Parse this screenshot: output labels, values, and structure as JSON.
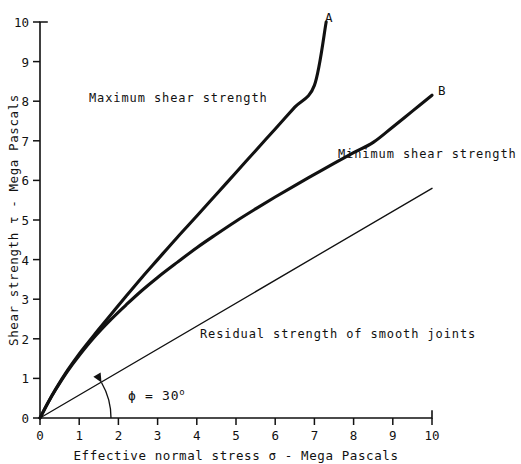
{
  "chart_data": {
    "type": "line",
    "title": "",
    "xlabel": "Effective normal stress σ - Mega Pascals",
    "ylabel": "Shear strength τ - Mega Pascals",
    "xlim": [
      0,
      10
    ],
    "ylim": [
      0,
      10
    ],
    "xticks": [
      0,
      1,
      2,
      3,
      4,
      5,
      6,
      7,
      8,
      9,
      10
    ],
    "yticks": [
      0,
      1,
      2,
      3,
      4,
      5,
      6,
      7,
      8,
      9,
      10
    ],
    "xtick_labels": [
      "0",
      "1",
      "2",
      "3",
      "4",
      "5",
      "6",
      "7",
      "8",
      "9",
      "10"
    ],
    "ytick_labels": [
      "0",
      "1",
      "2",
      "3",
      "4",
      "5",
      "6",
      "7",
      "8",
      "9",
      "10"
    ],
    "grid": false,
    "legend": "none",
    "series": [
      {
        "name": "Maximum shear strength",
        "endpoint_label": "A",
        "style": "thick-curve",
        "x": [
          0,
          0.2,
          0.4,
          0.7,
          1.0,
          1.4,
          1.8,
          2.2,
          2.6,
          3.0,
          3.5,
          4.0,
          4.5,
          5.0,
          5.5,
          6.0,
          6.5,
          7.0,
          7.3
        ],
        "y": [
          0,
          0.38,
          0.73,
          1.2,
          1.62,
          2.12,
          2.6,
          3.08,
          3.55,
          4.0,
          4.56,
          5.1,
          5.65,
          6.2,
          6.75,
          7.3,
          7.85,
          8.4,
          10.0
        ]
      },
      {
        "name": "Minimum shear strength",
        "endpoint_label": "B",
        "style": "thick-curve",
        "x": [
          0,
          0.2,
          0.4,
          0.7,
          1.0,
          1.4,
          1.8,
          2.2,
          2.6,
          3.0,
          3.5,
          4.0,
          4.5,
          5.0,
          5.5,
          6.0,
          6.5,
          7.0,
          7.5,
          8.0,
          8.5,
          9.0,
          9.5,
          10.0
        ],
        "y": [
          0,
          0.38,
          0.72,
          1.18,
          1.58,
          2.06,
          2.48,
          2.86,
          3.22,
          3.55,
          3.93,
          4.3,
          4.64,
          4.97,
          5.28,
          5.58,
          5.87,
          6.15,
          6.43,
          6.7,
          6.96,
          7.35,
          7.75,
          8.15
        ]
      },
      {
        "name": "Residual strength of smooth joints",
        "endpoint_label": "",
        "style": "thin-line",
        "x": [
          0,
          10
        ],
        "y": [
          0,
          5.8
        ]
      }
    ],
    "annotations": [
      {
        "name": "maximum-shear-strength-label",
        "text": "Maximum shear strength",
        "x": 1.25,
        "y": 8.05
      },
      {
        "name": "minimum-shear-strength-label",
        "text": "Minimum shear strength",
        "x": 7.6,
        "y": 6.4
      },
      {
        "name": "residual-strength-label",
        "text": "Residual strength of smooth joints",
        "x": 5.6,
        "y": 2.52
      },
      {
        "name": "point-a-label",
        "text": "A",
        "x": 7.45,
        "y": 10.05
      },
      {
        "name": "point-b-label",
        "text": "B",
        "x": 10.15,
        "y": 8.25
      },
      {
        "name": "friction-angle-label",
        "text": "ϕ = 30",
        "superscript": "o",
        "x": 2.25,
        "y": 0.78,
        "value_deg": 30
      }
    ]
  },
  "figure": {
    "axis_color": "#111111",
    "curve_color": "#111111",
    "background": "#ffffff"
  }
}
